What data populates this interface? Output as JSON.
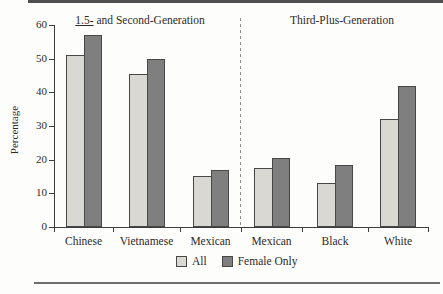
{
  "colors": {
    "background": "#fdfdfc",
    "text": "#2d2a26",
    "axis": "#3d3d3d",
    "bar_outline": "#474747",
    "divider": "#8e8e8e",
    "rule_top": "#4f4f4f",
    "rule_bottom": "#6e6e6e"
  },
  "chart_data": {
    "type": "bar",
    "title_left_underlined": "1.5-",
    "title_left_rest": " and Second-Generation",
    "title_right": "Third-Plus-Generation",
    "ylabel": "Percentage",
    "ylim": [
      0,
      60
    ],
    "yticks": [
      0,
      10,
      20,
      30,
      40,
      50,
      60
    ],
    "categories": [
      "Chinese",
      "Vietnamese",
      "Mexican",
      "Mexican",
      "Black",
      "White"
    ],
    "series": [
      {
        "name": "All",
        "color": "#d9d8d3",
        "values": [
          51,
          45.5,
          15,
          17.5,
          13,
          32
        ]
      },
      {
        "name": "Female Only",
        "color": "#7f7f7f",
        "values": [
          57,
          50,
          17,
          20.5,
          18.5,
          42
        ]
      }
    ],
    "divider_after_category": 3,
    "legend_position": "bottom",
    "grid": false
  }
}
